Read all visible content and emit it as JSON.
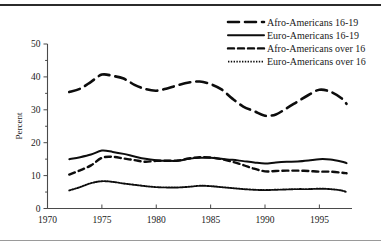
{
  "chart_data": {
    "type": "line",
    "title": "",
    "subtitle": "",
    "xlabel": "",
    "ylabel": "Percent",
    "xlim": [
      1970,
      1998
    ],
    "ylim": [
      0,
      50
    ],
    "grid": false,
    "legend_position": "top-right",
    "x_ticks": [
      1970,
      1975,
      1980,
      1985,
      1990,
      1995
    ],
    "x_tick_labels": [
      "1970",
      "1975",
      "1980",
      "1985",
      "1990",
      "1995"
    ],
    "x_minor_ticks": [],
    "y_ticks": [
      0,
      10,
      20,
      30,
      40,
      50
    ],
    "y_tick_labels": [
      "0",
      "10",
      "20",
      "30",
      "40",
      "50"
    ],
    "y_minor_ticks": [
      5,
      15,
      25,
      35,
      45
    ],
    "x": [
      1972,
      1973,
      1974,
      1975,
      1976,
      1977,
      1978,
      1979,
      1980,
      1981,
      1982,
      1983,
      1984,
      1985,
      1986,
      1987,
      1988,
      1989,
      1990,
      1991,
      1992,
      1993,
      1994,
      1995,
      1996,
      1997,
      1997.5
    ],
    "series": [
      {
        "name": "Afro-Americans 16-19",
        "linestyle": "long-dash",
        "values": [
          35.4,
          36.4,
          38.5,
          40.7,
          40.3,
          39.5,
          37.6,
          36.3,
          35.8,
          36.5,
          37.5,
          38.3,
          38.6,
          37.8,
          36.2,
          33.4,
          31.0,
          29.6,
          28.2,
          28.6,
          30.5,
          32.5,
          34.5,
          36.1,
          35.5,
          33.6,
          31.8
        ]
      },
      {
        "name": "Euro-Americans 16-19",
        "linestyle": "solid",
        "values": [
          15.0,
          15.6,
          16.4,
          17.6,
          17.2,
          16.6,
          15.8,
          15.1,
          14.7,
          14.5,
          14.5,
          15.1,
          15.4,
          15.4,
          15.1,
          14.8,
          14.4,
          14.0,
          13.7,
          14.0,
          14.2,
          14.3,
          14.6,
          15.0,
          14.9,
          14.3,
          13.8
        ]
      },
      {
        "name": "Afro-Americans over 16",
        "linestyle": "short-dash",
        "values": [
          10.3,
          11.6,
          13.1,
          15.4,
          15.7,
          15.2,
          14.7,
          14.2,
          14.5,
          14.5,
          14.6,
          15.2,
          15.6,
          15.5,
          15.0,
          14.2,
          13.2,
          12.1,
          11.3,
          11.4,
          11.5,
          11.5,
          11.4,
          11.2,
          11.2,
          10.9,
          10.7
        ]
      },
      {
        "name": "Euro-Americans over 16",
        "linestyle": "dotted",
        "values": [
          5.5,
          6.5,
          7.7,
          8.3,
          8.1,
          7.6,
          7.2,
          6.8,
          6.5,
          6.4,
          6.4,
          6.6,
          6.9,
          6.8,
          6.5,
          6.2,
          5.9,
          5.7,
          5.6,
          5.7,
          5.8,
          5.9,
          5.9,
          6.0,
          5.9,
          5.5,
          5.0
        ]
      }
    ],
    "legend_entries": [
      {
        "label": "Afro-Americans 16-19",
        "linestyle": "long-dash"
      },
      {
        "label": "Euro-Americans 16-19",
        "linestyle": "solid"
      },
      {
        "label": "Afro-Americans over 16",
        "linestyle": "short-dash"
      },
      {
        "label": "Euro-Americans over 16",
        "linestyle": "dotted"
      }
    ],
    "colors": {
      "line": "#0d0d0d",
      "axis": "#4a4a4a",
      "text": "#1a1a1a",
      "background": "#ffffff",
      "rule_top": "#2b2b2b",
      "rule_bottom": "#9a9a9a"
    }
  }
}
